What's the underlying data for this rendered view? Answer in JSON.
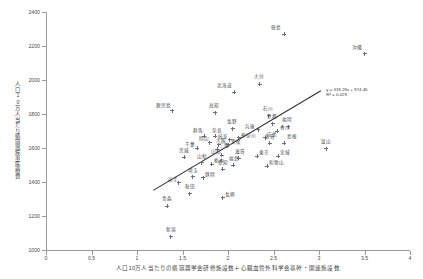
{
  "chart_data": {
    "type": "scatter",
    "title": "",
    "xlabel": "人口10万人当たりの循環器学会研修施設数＋心臓血管外科学会基幹・関連施設数",
    "ylabel": "人口10万人当たり循環器疾患医療費",
    "xlim": [
      0,
      4
    ],
    "ylim": [
      1000,
      2400
    ],
    "xticks": [
      0,
      0.5,
      1,
      1.5,
      2,
      2.5,
      3,
      3.5,
      4
    ],
    "xtick_labels": [
      "0",
      "0.5",
      "1",
      "1.5",
      "2",
      "2.5",
      "3",
      "3.5",
      "4"
    ],
    "yticks": [
      1000,
      1200,
      1400,
      1600,
      1800,
      2000,
      2200,
      2400
    ],
    "ytick_labels": [
      "1000",
      "1200",
      "1400",
      "1600",
      "1800",
      "2000",
      "2200",
      "2400"
    ],
    "grid": false,
    "legend": "none",
    "marker": "plus-dot",
    "marker_color": "#6b6b80",
    "trendline": {
      "type": "linear",
      "slope": 318.28,
      "intercept": 974.46,
      "r_squared": 0.429,
      "equation_label": "y = 318.28x + 974.46",
      "r2_label": "R² = 0.429",
      "color": "#2a2a2a",
      "x_start": 1.18,
      "x_end": 3.02
    },
    "points": [
      {
        "label": "徳島",
        "x": 2.62,
        "y": 2270,
        "lx": -13,
        "ly": -5
      },
      {
        "label": "沖縄",
        "x": 3.5,
        "y": 2155,
        "lx": -13,
        "ly": -5
      },
      {
        "label": "大分",
        "x": 2.35,
        "y": 1975,
        "lx": -6,
        "ly": -6
      },
      {
        "label": "北海道",
        "x": 2.07,
        "y": 1928,
        "lx": -17,
        "ly": -5
      },
      {
        "label": "鹿児島",
        "x": 1.39,
        "y": 1818,
        "lx": -16,
        "ly": -4
      },
      {
        "label": "高知",
        "x": 1.86,
        "y": 1806,
        "lx": -6,
        "ly": -6
      },
      {
        "label": "石川",
        "x": 2.45,
        "y": 1790,
        "lx": -6,
        "ly": -6
      },
      {
        "label": "京都",
        "x": 2.49,
        "y": 1742,
        "lx": -6,
        "ly": -6
      },
      {
        "label": "福岡",
        "x": 2.66,
        "y": 1725,
        "lx": -6,
        "ly": -6
      },
      {
        "label": "長野",
        "x": 2.05,
        "y": 1712,
        "lx": -6,
        "ly": -6
      },
      {
        "label": "兵庫",
        "x": 2.33,
        "y": 1706,
        "lx": -13,
        "ly": -2
      },
      {
        "label": "香川",
        "x": 2.54,
        "y": 1700,
        "lx": 3,
        "ly": -2
      },
      {
        "label": "群馬",
        "x": 1.74,
        "y": 1668,
        "lx": -11,
        "ly": -4
      },
      {
        "label": "奈良",
        "x": 1.86,
        "y": 1668,
        "lx": -3,
        "ly": -4
      },
      {
        "label": "神奈川",
        "x": 2.12,
        "y": 1660,
        "lx": 2,
        "ly": -1
      },
      {
        "label": "岐阜",
        "x": 2.02,
        "y": 1648,
        "lx": -12,
        "ly": -2
      },
      {
        "label": "広島",
        "x": 2.41,
        "y": 1660,
        "lx": 2,
        "ly": -2
      },
      {
        "label": "岡山",
        "x": 1.8,
        "y": 1630,
        "lx": -11,
        "ly": -3
      },
      {
        "label": "大阪",
        "x": 1.9,
        "y": 1620,
        "lx": -3,
        "ly": -3
      },
      {
        "label": "愛媛",
        "x": 2.01,
        "y": 1618,
        "lx": 2,
        "ly": -2
      },
      {
        "label": "佐賀",
        "x": 2.46,
        "y": 1628,
        "lx": -5,
        "ly": -5
      },
      {
        "label": "島根",
        "x": 2.62,
        "y": 1628,
        "lx": 3,
        "ly": -5
      },
      {
        "label": "千葉",
        "x": 1.66,
        "y": 1600,
        "lx": -12,
        "ly": -2
      },
      {
        "label": "三重",
        "x": 1.88,
        "y": 1592,
        "lx": 2,
        "ly": -2
      },
      {
        "label": "富山",
        "x": 3.08,
        "y": 1595,
        "lx": -5,
        "ly": -6
      },
      {
        "label": "山形",
        "x": 1.93,
        "y": 1558,
        "lx": -11,
        "ly": -2
      },
      {
        "label": "茨城",
        "x": 1.52,
        "y": 1545,
        "lx": -5,
        "ly": -5
      },
      {
        "label": "東京",
        "x": 2.32,
        "y": 1552,
        "lx": 2,
        "ly": -2
      },
      {
        "label": "滋賀",
        "x": 2.12,
        "y": 1540,
        "lx": -4,
        "ly": -5
      },
      {
        "label": "宮城",
        "x": 2.55,
        "y": 1552,
        "lx": 2,
        "ly": -2
      },
      {
        "label": "山梨",
        "x": 1.71,
        "y": 1512,
        "lx": -5,
        "ly": -5
      },
      {
        "label": "栃木",
        "x": 1.82,
        "y": 1505,
        "lx": 2,
        "ly": -2
      },
      {
        "label": "福島",
        "x": 2.06,
        "y": 1500,
        "lx": -4,
        "ly": -5
      },
      {
        "label": "和歌山",
        "x": 2.43,
        "y": 1492,
        "lx": 2,
        "ly": -2
      },
      {
        "label": "愛知",
        "x": 1.94,
        "y": 1475,
        "lx": -5,
        "ly": -5
      },
      {
        "label": "埼玉",
        "x": 1.61,
        "y": 1430,
        "lx": -5,
        "ly": -5
      },
      {
        "label": "静岡",
        "x": 1.73,
        "y": 1425,
        "lx": 2,
        "ly": -2
      },
      {
        "label": "岩手",
        "x": 1.46,
        "y": 1395,
        "lx": -11,
        "ly": -2
      },
      {
        "label": "秋田",
        "x": 1.58,
        "y": 1330,
        "lx": -5,
        "ly": -6
      },
      {
        "label": "長崎",
        "x": 1.94,
        "y": 1308,
        "lx": 2,
        "ly": -2
      },
      {
        "label": "青森",
        "x": 1.33,
        "y": 1258,
        "lx": -5,
        "ly": -6
      },
      {
        "label": "新潟",
        "x": 1.37,
        "y": 1078,
        "lx": -5,
        "ly": -6
      }
    ]
  }
}
